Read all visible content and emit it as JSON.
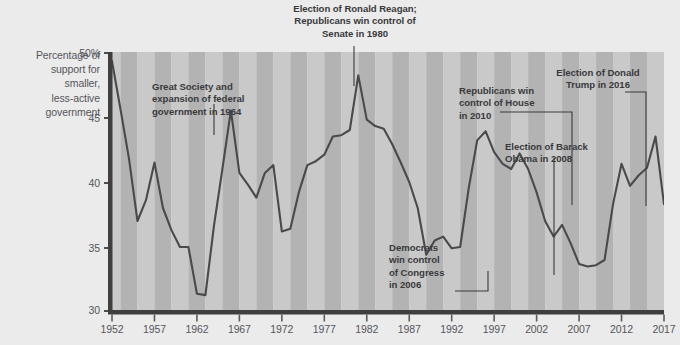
{
  "figure": {
    "background_color": "#ebebeb",
    "plot_stripe_light": "#c9c9c9",
    "plot_stripe_dark": "#b3b3b3",
    "line_color": "#4a4a4a",
    "axis_color": "#403f3f"
  },
  "axis_title": {
    "line1": "Percentage of",
    "line2": "support for",
    "line3": "smaller,",
    "line4": "less-active",
    "line5": "government"
  },
  "annotations": [
    {
      "id": "great-society",
      "line1": "Great Society and",
      "line2": "expansion of federal",
      "line3": "government in 1964",
      "target_year": 1964
    },
    {
      "id": "reagan-1980",
      "line1": "Election of Ronald Reagan;",
      "line2": "Republicans win control of",
      "line3": "Senate in 1980",
      "target_year": 1980
    },
    {
      "id": "democrats-2006",
      "line1": "Democrats",
      "line2": "win control",
      "line3": "of Congress",
      "line4": "in 2006",
      "target_year": 2006
    },
    {
      "id": "obama-2008",
      "line1": "Election of Barack",
      "line2": "Obama in 2008",
      "target_year": 2008
    },
    {
      "id": "republicans-2010",
      "line1": "Republicans win",
      "line2": "control of House",
      "line3": "in 2010",
      "target_year": 2010
    },
    {
      "id": "trump-2016",
      "line1": "Election of Donald",
      "line2": "Trump in 2016",
      "target_year": 2016
    }
  ],
  "chart_data": {
    "type": "line",
    "title": "",
    "subtitle": "",
    "xlabel": "",
    "ylabel": "Percentage of support for smaller, less-active government",
    "xlim": [
      1952,
      2017
    ],
    "ylim": [
      30,
      50
    ],
    "grid": false,
    "legend": null,
    "ytick_labels": [
      "30",
      "35",
      "40",
      "45",
      "50%"
    ],
    "ytick_values": [
      30,
      35,
      40,
      45,
      50
    ],
    "xtick_labels": [
      "1952",
      "1957",
      "1962",
      "1967",
      "1972",
      "1977",
      "1982",
      "1987",
      "1992",
      "1997",
      "2002",
      "2007",
      "2012",
      "2017"
    ],
    "xtick_values": [
      1952,
      1957,
      1962,
      1967,
      1972,
      1977,
      1982,
      1987,
      1992,
      1997,
      2002,
      2007,
      2012,
      2017
    ],
    "series": [
      {
        "name": "Support for smaller, less-active government",
        "x": [
          1952,
          1953,
          1954,
          1955,
          1956,
          1957,
          1958,
          1959,
          1960,
          1961,
          1962,
          1963,
          1964,
          1965,
          1966,
          1967,
          1968,
          1969,
          1970,
          1971,
          1972,
          1973,
          1974,
          1975,
          1976,
          1977,
          1978,
          1979,
          1980,
          1981,
          1982,
          1983,
          1984,
          1985,
          1986,
          1987,
          1988,
          1989,
          1990,
          1991,
          1992,
          1993,
          1994,
          1995,
          1996,
          1997,
          1998,
          1999,
          2000,
          2001,
          2002,
          2003,
          2004,
          2005,
          2006,
          2007,
          2008,
          2009,
          2010,
          2011,
          2012,
          2013,
          2014,
          2015,
          2016,
          2017
        ],
        "y": [
          49.3,
          45.6,
          41.8,
          37.0,
          38.6,
          41.5,
          38.0,
          36.3,
          35.0,
          35.0,
          31.4,
          31.3,
          36.6,
          41.0,
          45.5,
          40.7,
          39.8,
          38.8,
          40.7,
          41.3,
          36.2,
          36.4,
          39.2,
          41.3,
          41.6,
          42.1,
          43.5,
          43.6,
          44.0,
          48.2,
          44.8,
          44.3,
          44.1,
          42.9,
          41.5,
          40.0,
          38.0,
          34.4,
          35.5,
          35.8,
          34.9,
          35.0,
          39.5,
          43.2,
          43.9,
          42.3,
          41.4,
          41.0,
          42.2,
          41.0,
          39.2,
          37.0,
          35.8,
          36.7,
          35.3,
          33.7,
          33.5,
          33.6,
          34.0,
          38.3,
          41.4,
          39.7,
          40.5,
          41.1,
          43.5,
          38.3
        ],
        "color": "#4a4a4a"
      }
    ]
  }
}
